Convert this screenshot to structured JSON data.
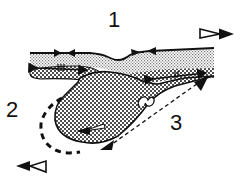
{
  "diagram": {
    "labels": {
      "one": "1",
      "two": "2",
      "three": "3"
    },
    "colors": {
      "ink": "#111111",
      "background": "#ffffff",
      "light_stipple": "#bdbdbd",
      "dense_stipple": "#111111"
    },
    "elements": {
      "upper_layer": "light-stippled layer",
      "lower_layer": "dense-stippled layer",
      "drip_body": "dense-stippled droplet body",
      "top_right_arrow": "open-arrow-right",
      "bottom_left_arrow": "open-arrow-left",
      "converging_arrows": "surface convergence arrows (2 pairs)",
      "dashed_boundary": "dashed curve labelled 2",
      "double_arrow": "dashed double-headed arrow labelled 3"
    }
  }
}
